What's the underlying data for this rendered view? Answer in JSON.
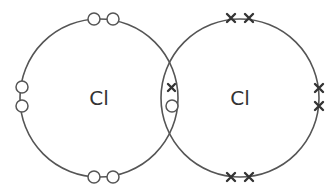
{
  "diagram": {
    "type": "dot-and-cross",
    "molecule": "Cl2",
    "atoms": [
      {
        "symbol": "Cl",
        "electron_marker": "dot",
        "outer_electrons": 7
      },
      {
        "symbol": "Cl",
        "electron_marker": "cross",
        "outer_electrons": 7
      }
    ],
    "shared_pair": [
      "cross",
      "dot"
    ],
    "colors": {
      "line": "#555555",
      "text": "#333333"
    }
  }
}
